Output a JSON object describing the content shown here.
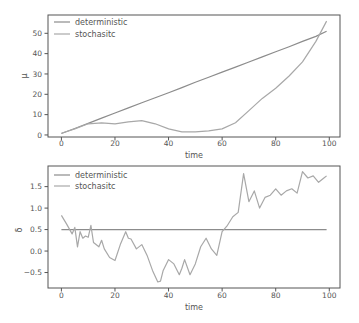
{
  "chart_data": [
    {
      "type": "line",
      "title": "",
      "xlabel": "time",
      "ylabel": "μ",
      "xlim": [
        -5,
        104
      ],
      "ylim": [
        -1,
        59
      ],
      "xticks": [
        0,
        20,
        40,
        60,
        80,
        100
      ],
      "xtick_labels": [
        "0",
        "20",
        "40",
        "60",
        "80",
        "100"
      ],
      "yticks": [
        0,
        10,
        20,
        30,
        40,
        50
      ],
      "ytick_labels": [
        "0",
        "10",
        "20",
        "30",
        "40",
        "50"
      ],
      "grid": false,
      "legend_position": "upper left",
      "x": [
        0,
        5,
        10,
        15,
        20,
        25,
        30,
        35,
        40,
        45,
        50,
        55,
        60,
        65,
        70,
        75,
        80,
        85,
        90,
        95,
        99
      ],
      "series": [
        {
          "name": "deterministic",
          "color": "#8c8c8c",
          "values": [
            0.7,
            3.2,
            5.7,
            8.3,
            10.8,
            13.3,
            15.8,
            18.3,
            20.8,
            23.3,
            25.9,
            28.4,
            30.9,
            33.4,
            35.9,
            38.4,
            40.9,
            43.4,
            46.0,
            48.5,
            51.0
          ]
        },
        {
          "name": "stochasitc",
          "color": "#a8a8a8",
          "values": [
            0.8,
            3.0,
            5.5,
            6.0,
            5.5,
            6.5,
            7.0,
            5.5,
            3.0,
            1.5,
            1.5,
            2.0,
            3.0,
            6.0,
            12.0,
            18.0,
            23.0,
            29.0,
            36.0,
            46.0,
            56.0
          ]
        }
      ]
    },
    {
      "type": "line",
      "title": "",
      "xlabel": "time",
      "ylabel": "δ",
      "xlim": [
        -5,
        104
      ],
      "ylim": [
        -0.86,
        1.98
      ],
      "xticks": [
        0,
        20,
        40,
        60,
        80,
        100
      ],
      "xtick_labels": [
        "0",
        "20",
        "40",
        "60",
        "80",
        "100"
      ],
      "yticks": [
        -0.5,
        0.0,
        0.5,
        1.0,
        1.5
      ],
      "ytick_labels": [
        "−0.5",
        "0.0",
        "0.5",
        "1.0",
        "1.5"
      ],
      "grid": false,
      "legend_position": "upper left",
      "x": [
        0,
        2,
        4,
        5,
        6,
        7,
        8,
        9,
        10,
        11,
        12,
        14,
        15,
        16,
        18,
        20,
        22,
        24,
        25,
        26,
        28,
        30,
        32,
        34,
        36,
        37,
        38,
        40,
        42,
        44,
        45,
        46,
        48,
        50,
        52,
        54,
        56,
        58,
        60,
        62,
        64,
        66,
        68,
        70,
        72,
        74,
        76,
        78,
        80,
        82,
        84,
        86,
        88,
        90,
        92,
        94,
        96,
        98,
        99
      ],
      "series": [
        {
          "name": "deterministic",
          "color": "#8c8c8c",
          "values": [
            0.5,
            0.5,
            0.5,
            0.5,
            0.5,
            0.5,
            0.5,
            0.5,
            0.5,
            0.5,
            0.5,
            0.5,
            0.5,
            0.5,
            0.5,
            0.5,
            0.5,
            0.5,
            0.5,
            0.5,
            0.5,
            0.5,
            0.5,
            0.5,
            0.5,
            0.5,
            0.5,
            0.5,
            0.5,
            0.5,
            0.5,
            0.5,
            0.5,
            0.5,
            0.5,
            0.5,
            0.5,
            0.5,
            0.5,
            0.5,
            0.5,
            0.5,
            0.5,
            0.5,
            0.5,
            0.5,
            0.5,
            0.5,
            0.5,
            0.5,
            0.5,
            0.5,
            0.5,
            0.5,
            0.5,
            0.5,
            0.5,
            0.5,
            0.5
          ]
        },
        {
          "name": "stochasitc",
          "color": "#a8a8a8",
          "values": [
            0.83,
            0.62,
            0.4,
            0.55,
            0.1,
            0.45,
            0.3,
            0.35,
            0.32,
            0.6,
            0.2,
            0.1,
            0.25,
            0.05,
            -0.15,
            -0.22,
            0.15,
            0.45,
            0.3,
            0.28,
            0.05,
            0.15,
            -0.1,
            -0.45,
            -0.72,
            -0.7,
            -0.45,
            -0.2,
            -0.3,
            -0.55,
            -0.4,
            -0.2,
            -0.55,
            -0.3,
            0.1,
            0.3,
            0.05,
            -0.1,
            0.45,
            0.6,
            0.8,
            0.9,
            1.8,
            1.15,
            1.4,
            1.0,
            1.25,
            1.3,
            1.45,
            1.3,
            1.4,
            1.45,
            1.35,
            1.85,
            1.7,
            1.75,
            1.6,
            1.7,
            1.75
          ]
        }
      ]
    }
  ],
  "legend": {
    "labels": [
      "deterministic",
      "stochasitc"
    ]
  }
}
